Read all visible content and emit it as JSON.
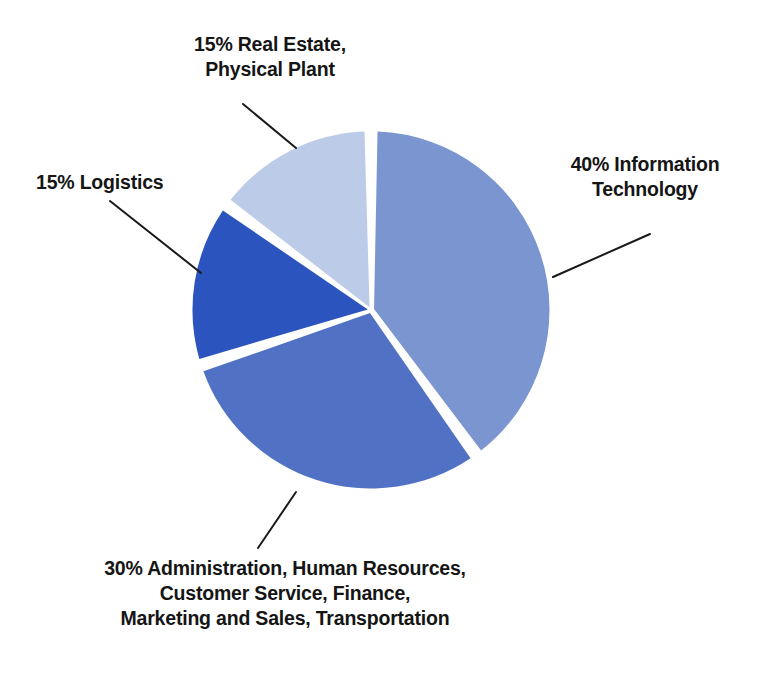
{
  "chart_data": {
    "type": "pie",
    "title": "",
    "subtitle": "",
    "xlabel": "",
    "ylabel": "",
    "legend_position": "callout-labels",
    "grid": false,
    "start_angle_deg": 0,
    "direction": "clockwise",
    "categories": [
      "Information Technology",
      "Administration, Human Resources, Customer Service, Finance, Marketing and Sales, Transportation",
      "Logistics",
      "Real Estate, Physical Plant"
    ],
    "values": [
      40,
      30,
      15,
      15
    ],
    "value_unit": "%",
    "slices": [
      {
        "name": "information-technology",
        "percent": 40,
        "color": "#7B95D0",
        "label_lines": [
          "40% Information",
          "Technology"
        ],
        "label_text": "40% Information Technology"
      },
      {
        "name": "administration",
        "percent": 30,
        "color": "#5172C4",
        "label_lines": [
          "30% Administration, Human Resources,",
          "Customer Service, Finance,",
          "Marketing and Sales, Transportation"
        ],
        "label_text": "30% Administration, Human Resources, Customer Service, Finance, Marketing and Sales, Transportation"
      },
      {
        "name": "logistics",
        "percent": 15,
        "color": "#2B54BE",
        "label_lines": [
          "15% Logistics"
        ],
        "label_text": "15% Logistics"
      },
      {
        "name": "real-estate",
        "percent": 15,
        "color": "#BCCBE8",
        "label_lines": [
          "15% Real Estate,",
          "Physical Plant"
        ],
        "label_text": "15% Real Estate, Physical Plant"
      }
    ]
  },
  "labels": {
    "real_estate": "15% Real Estate,\nPhysical Plant",
    "logistics": "15% Logistics",
    "information_technology": "40% Information\nTechnology",
    "administration": "30% Administration, Human Resources,\nCustomer Service, Finance,\nMarketing and Sales, Transportation"
  },
  "colors": {
    "background": "#ffffff",
    "separator": "#ffffff",
    "leader_line": "#1a1a1a",
    "text": "#151515",
    "slice_information_technology": "#7B95D0",
    "slice_administration": "#5172C4",
    "slice_logistics": "#2B54BE",
    "slice_real_estate": "#BCCBE8"
  }
}
